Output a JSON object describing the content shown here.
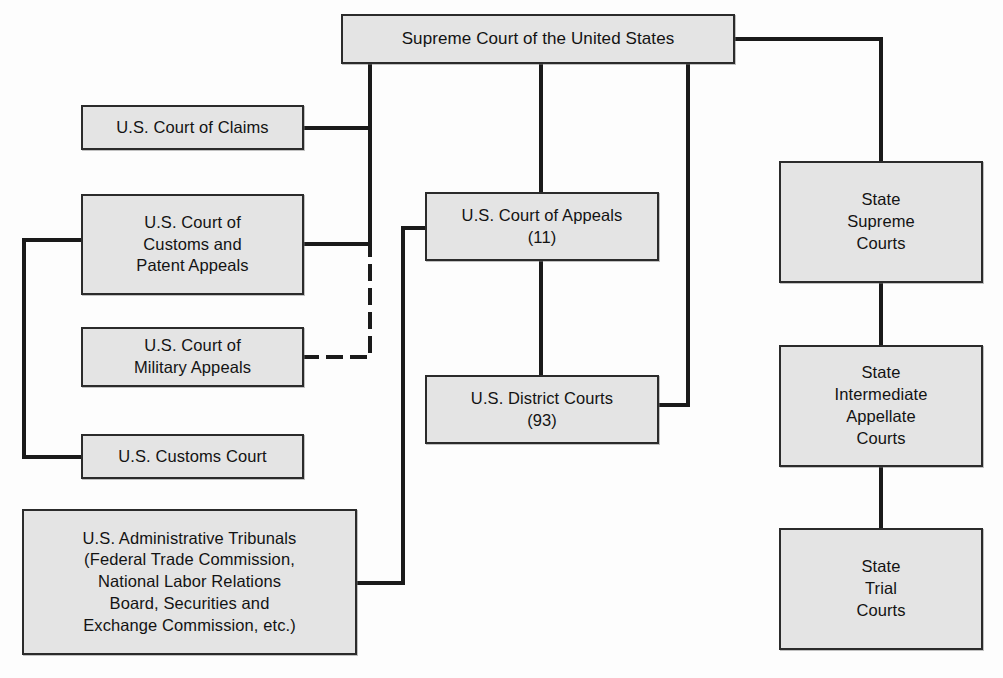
{
  "diagram": {
    "type": "organizational-flow-chart",
    "canvas": {
      "width": 1003,
      "height": 678
    },
    "style": {
      "box_fill": "#e4e4e4",
      "box_border": "#2b2b2b",
      "line_color": "#1a1a1a",
      "text_color": "#131313",
      "background": "#fdfdfd"
    },
    "nodes": [
      {
        "id": "supreme-court-us",
        "label": "Supreme Court of the United States",
        "x": 341,
        "y": 14,
        "w": 394,
        "h": 50,
        "font_size": 17
      },
      {
        "id": "court-of-claims",
        "label": "U.S. Court of Claims",
        "x": 81,
        "y": 105,
        "w": 223,
        "h": 45,
        "font_size": 16.5
      },
      {
        "id": "court-customs-patent-appeals",
        "label": "U.S. Court of\nCustoms and\nPatent Appeals",
        "x": 81,
        "y": 194,
        "w": 223,
        "h": 101,
        "font_size": 16.5
      },
      {
        "id": "court-military-appeals",
        "label": "U.S. Court of\nMilitary Appeals",
        "x": 81,
        "y": 327,
        "w": 223,
        "h": 60,
        "font_size": 16.5
      },
      {
        "id": "customs-court",
        "label": "U.S. Customs Court",
        "x": 81,
        "y": 434,
        "w": 223,
        "h": 45,
        "font_size": 16.5
      },
      {
        "id": "administrative-tribunals",
        "label": "U.S. Administrative Tribunals\n(Federal Trade Commission,\nNational Labor Relations\nBoard, Securities and\nExchange Commission, etc.)",
        "x": 22,
        "y": 509,
        "w": 335,
        "h": 146,
        "font_size": 16.5
      },
      {
        "id": "court-of-appeals",
        "label": "U.S. Court of Appeals\n(11)",
        "x": 425,
        "y": 192,
        "w": 234,
        "h": 69,
        "font_size": 16.5
      },
      {
        "id": "district-courts",
        "label": "U.S. District Courts\n(93)",
        "x": 425,
        "y": 375,
        "w": 234,
        "h": 69,
        "font_size": 16.5
      },
      {
        "id": "state-supreme-courts",
        "label": "State\nSupreme\nCourts",
        "x": 779,
        "y": 161,
        "w": 204,
        "h": 122,
        "font_size": 16.5
      },
      {
        "id": "state-intermediate-appellate-courts",
        "label": "State\nIntermediate\nAppellate\nCourts",
        "x": 779,
        "y": 345,
        "w": 204,
        "h": 122,
        "font_size": 16.5
      },
      {
        "id": "state-trial-courts",
        "label": "State\nTrial\nCourts",
        "x": 779,
        "y": 528,
        "w": 204,
        "h": 122,
        "font_size": 16.5
      }
    ],
    "edges": [
      {
        "id": "edge-supreme-to-federal-left-trunk",
        "from": "supreme-court-us",
        "to": "court-customs-patent-appeals",
        "style": "solid",
        "points": "370,64 370,244 304,244"
      },
      {
        "id": "edge-trunk-to-court-of-claims",
        "from": "supreme-court-us",
        "to": "court-of-claims",
        "style": "solid",
        "points": "370,128 304,128"
      },
      {
        "id": "edge-customs-court-to-patent-appeals",
        "from": "customs-court",
        "to": "court-customs-patent-appeals",
        "style": "solid",
        "points": "81,457 24,457 24,240 81,240"
      },
      {
        "id": "edge-military-appeals-dashed",
        "from": "court-military-appeals",
        "to": "court-customs-patent-appeals",
        "style": "dashed",
        "points": "304,357 370,357 370,247"
      },
      {
        "id": "edge-supreme-to-court-of-appeals",
        "from": "supreme-court-us",
        "to": "court-of-appeals",
        "style": "solid",
        "points": "541,64 541,192"
      },
      {
        "id": "edge-court-of-appeals-to-district-courts",
        "from": "court-of-appeals",
        "to": "district-courts",
        "style": "solid",
        "points": "541,261 541,375"
      },
      {
        "id": "edge-admin-tribunals-to-court-of-appeals",
        "from": "administrative-tribunals",
        "to": "court-of-appeals",
        "style": "solid",
        "points": "357,583 403,583 403,228 425,228"
      },
      {
        "id": "edge-district-courts-to-supreme",
        "from": "district-courts",
        "to": "supreme-court-us",
        "style": "solid",
        "points": "659,405 688,405 688,64"
      },
      {
        "id": "edge-supreme-to-state-supreme",
        "from": "supreme-court-us",
        "to": "state-supreme-courts",
        "style": "solid",
        "points": "735,39 881,39 881,161"
      },
      {
        "id": "edge-state-supreme-to-intermediate",
        "from": "state-supreme-courts",
        "to": "state-intermediate-appellate-courts",
        "style": "solid",
        "points": "881,283 881,345"
      },
      {
        "id": "edge-state-intermediate-to-trial",
        "from": "state-intermediate-appellate-courts",
        "to": "state-trial-courts",
        "style": "solid",
        "points": "881,467 881,528"
      }
    ]
  }
}
